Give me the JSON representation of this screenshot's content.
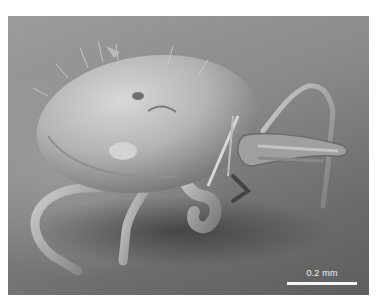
{
  "image": {
    "subject": "scanning electron micrograph of a mite",
    "scale_bar": {
      "label": "0.2 mm"
    }
  }
}
